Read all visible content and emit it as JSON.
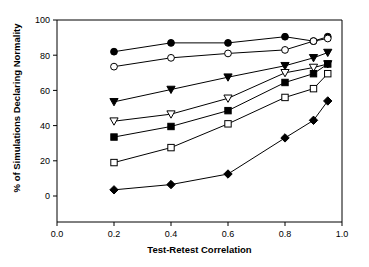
{
  "figure": {
    "width": 369,
    "height": 267,
    "background": "#ffffff",
    "ink_color": "#000000"
  },
  "chart_data": {
    "type": "line",
    "title": "",
    "subtitle": "",
    "xlabel": "Test-Retest Correlation",
    "ylabel": "% of Simulations Declaring Normality",
    "xlim": [
      0.0,
      1.0
    ],
    "ylim": [
      0,
      100
    ],
    "xticks": [
      0.0,
      0.2,
      0.4,
      0.6,
      0.8,
      1.0
    ],
    "xticklabels": [
      "0.0",
      "0.2",
      "0.4",
      "0.6",
      "0.8",
      "1.0"
    ],
    "yticks": [
      0,
      20,
      40,
      60,
      80,
      100
    ],
    "yticklabels": [
      "0",
      "20",
      "40",
      "60",
      "80",
      "100"
    ],
    "grid": false,
    "legend": "none",
    "legend_position": "none",
    "x": [
      0.2,
      0.4,
      0.6,
      0.8,
      0.9,
      0.95
    ],
    "series": [
      {
        "name": "series-1",
        "marker": "filled-circle",
        "values": [
          82,
          87,
          87,
          90.5,
          88,
          90.5
        ]
      },
      {
        "name": "series-2",
        "marker": "open-circle",
        "values": [
          73.5,
          78.5,
          81,
          83,
          88,
          89.5
        ]
      },
      {
        "name": "series-3",
        "marker": "filled-triangle-down",
        "values": [
          53.5,
          60.5,
          67.5,
          74,
          78.5,
          81.5
        ]
      },
      {
        "name": "series-4",
        "marker": "open-triangle-down",
        "values": [
          42.5,
          46.5,
          55.5,
          70,
          73,
          75
        ]
      },
      {
        "name": "series-5",
        "marker": "filled-square",
        "values": [
          33.5,
          39.5,
          48.5,
          64.5,
          69.5,
          75
        ]
      },
      {
        "name": "series-6",
        "marker": "open-square",
        "values": [
          19,
          27.5,
          41,
          56,
          61,
          69.5
        ]
      },
      {
        "name": "series-7",
        "marker": "filled-diamond",
        "values": [
          3.5,
          6.5,
          12.5,
          33,
          43,
          54
        ]
      }
    ]
  }
}
